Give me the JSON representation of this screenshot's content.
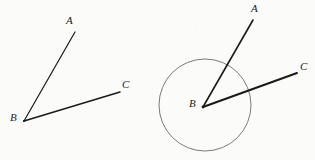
{
  "figure": {
    "background_color": "#fbfbfa",
    "stroke_color": "#1c1a18",
    "circle_stroke_color": "#6e6c6a",
    "label_color": "#24221f",
    "canvas": {
      "width": 315,
      "height": 160
    }
  },
  "left_figure": {
    "name": "angle-abc-plain",
    "vertex": {
      "label": "B",
      "x": 24,
      "y": 121,
      "label_x": 10,
      "label_y": 112
    },
    "ray_a": {
      "label": "A",
      "x": 75,
      "y": 32,
      "label_x": 66,
      "label_y": 15,
      "stroke_width": 1.2
    },
    "ray_c": {
      "label": "C",
      "x": 120,
      "y": 92,
      "label_x": 122,
      "label_y": 79,
      "stroke_width": 1.4
    }
  },
  "right_figure": {
    "name": "angle-abc-with-circle",
    "vertex": {
      "label": "B",
      "x": 203,
      "y": 107,
      "label_x": 189,
      "label_y": 98,
      "label_dot": true
    },
    "ray_a": {
      "label": "A",
      "x": 253,
      "y": 20,
      "label_x": 251,
      "label_y": 3,
      "stroke_width": 1.6
    },
    "ray_c": {
      "label": "C",
      "x": 297,
      "y": 73,
      "label_x": 300,
      "label_y": 61,
      "stroke_width": 1.8
    },
    "circle": {
      "center_x": 205,
      "center_y": 105,
      "radius": 46,
      "stroke_width": 0.9
    }
  },
  "labels": {
    "left_a": "A",
    "left_b": "B",
    "left_c": "C",
    "right_a": "A",
    "right_b": "B",
    "right_c": "C"
  }
}
